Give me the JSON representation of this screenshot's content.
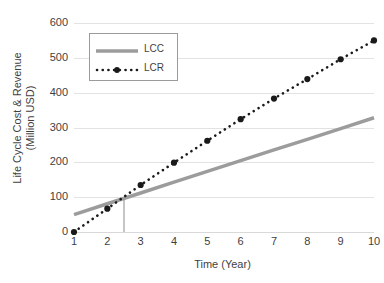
{
  "chart_data": {
    "type": "line",
    "title": "",
    "xlabel": "Time (Year)",
    "ylabel": "Life Cycle Cost & Revenue (Million USD)",
    "ylabel_line1": "Life Cycle Cost & Revenue",
    "ylabel_line2": "(Million USD)",
    "x": [
      1,
      2,
      3,
      4,
      5,
      6,
      7,
      8,
      9,
      10
    ],
    "categories": [
      "1",
      "2",
      "3",
      "4",
      "5",
      "6",
      "7",
      "8",
      "9",
      "10"
    ],
    "xtick_labels": [
      "1",
      "2",
      "3",
      "4",
      "5",
      "6",
      "7",
      "8",
      "9",
      "10"
    ],
    "ytick_labels": [
      "0",
      "100",
      "200",
      "300",
      "400",
      "500",
      "600"
    ],
    "yticks": [
      0,
      100,
      200,
      300,
      400,
      500,
      600
    ],
    "ylim": [
      0,
      600
    ],
    "xlim": [
      1,
      10
    ],
    "grid": true,
    "grid_axis": "y",
    "legend_position": "upper left",
    "series": [
      {
        "name": "LCC",
        "label": "LCC",
        "style": "solid",
        "color": "#9c9c9c",
        "width": 3.5,
        "markers": false,
        "values": [
          50,
          81,
          112,
          143,
          174,
          205,
          236,
          266,
          297,
          328
        ]
      },
      {
        "name": "LCR",
        "label": "LCR",
        "style": "dotted",
        "color": "#1a1a1a",
        "width": 2.5,
        "markers": true,
        "values": [
          0,
          67,
          135,
          199,
          262,
          324,
          383,
          439,
          496,
          550
        ]
      }
    ],
    "annotations": [
      {
        "name": "breakeven-dropline",
        "type": "vline",
        "x": 2.5,
        "y_top": 100,
        "y_bottom": 0,
        "color": "#8c8c8c"
      }
    ]
  },
  "legend": {
    "entries": [
      {
        "label": "LCC"
      },
      {
        "label": "LCR"
      }
    ]
  }
}
